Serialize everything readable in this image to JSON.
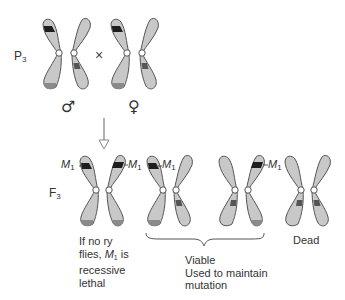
{
  "colors": {
    "chromosome_fill": "#c8c8c8",
    "chromosome_stroke": "#555555",
    "band_dark": "#1e1e1e",
    "band_mid": "#555555",
    "tip_shade": "#8a8a8a",
    "arrow": "#888888"
  },
  "labels": {
    "parental_generation": "P",
    "parental_subscript": "3",
    "filial_generation": "F",
    "filial_subscript": "3",
    "cross_symbol": "×",
    "male_symbol": "♂",
    "female_symbol": "♀",
    "mutation_label": "M",
    "mutation_subscript": "1"
  },
  "notes": {
    "lethal_line1": "If no ry",
    "lethal_line2_pre": "flies, ",
    "lethal_line2_m": "M",
    "lethal_line2_sub": "1",
    "lethal_line2_post": " is",
    "lethal_line3": "recessive",
    "lethal_line4": "lethal",
    "viable_line1": "Viable",
    "viable_line2": "Used to maintain",
    "viable_line3": "mutation",
    "dead": "Dead"
  },
  "diagram": {
    "parents": [
      {
        "sex": "male",
        "chromosomes": [
          "M1 + tip shade",
          "middle band"
        ]
      },
      {
        "sex": "female",
        "chromosomes": [
          "M1 + tip shade",
          "middle band"
        ]
      }
    ],
    "offspring": [
      {
        "genotype": "M1/M1",
        "outcome": "If no ry flies, M1 is recessive lethal"
      },
      {
        "genotype": "M1/+",
        "outcome": "Viable"
      },
      {
        "genotype": "+/M1",
        "outcome": "Viable"
      },
      {
        "genotype": "+/+",
        "outcome": "Dead"
      }
    ]
  }
}
